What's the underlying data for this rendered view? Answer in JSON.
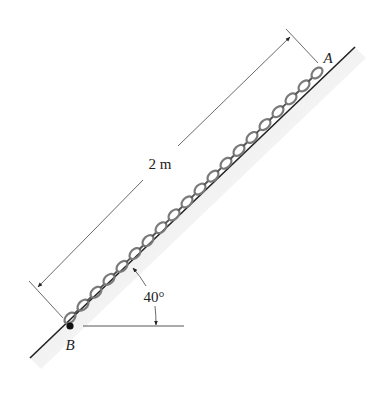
{
  "figure": {
    "type": "statics-diagram",
    "dimension_label": "2 m",
    "angle_label": "40°",
    "point_labels": {
      "top": "A",
      "bottom": "B"
    },
    "chain_links": 20,
    "colors": {
      "line": "#222222",
      "chain": "#8a8a8a",
      "shade": "#d8d8d8"
    }
  }
}
